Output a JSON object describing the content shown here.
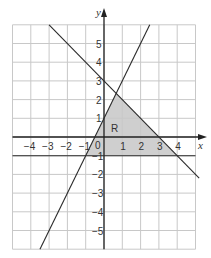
{
  "figure": {
    "axes": {
      "x_label": "x",
      "y_label": "y",
      "x_range": [
        -5,
        5
      ],
      "y_range": [
        -6,
        6
      ],
      "grid": true
    },
    "x_ticks": [
      "-4",
      "-3",
      "-2",
      "-1",
      "1",
      "2",
      "3",
      "4"
    ],
    "y_ticks": [
      "5",
      "4",
      "3",
      "2",
      "1",
      "-1",
      "-2",
      "-3",
      "-4",
      "-5"
    ],
    "origin_label": "0",
    "region_label": "R",
    "lines": [
      {
        "name": "y = 2x + 1",
        "from": [
          -3.5,
          -6
        ],
        "to": [
          2.5,
          6
        ]
      },
      {
        "name": "x + y = 3",
        "from": [
          -3,
          6
        ],
        "to": [
          5.2,
          -2.2
        ]
      },
      {
        "name": "y = -1",
        "from": [
          -5,
          -1
        ],
        "to": [
          5,
          -1
        ]
      }
    ],
    "region_vertices": [
      [
        -1,
        -1
      ],
      [
        0.667,
        2.333
      ],
      [
        4,
        -1
      ]
    ],
    "colors": {
      "shade": "#cfcfcf",
      "grid": "#c8c8c8",
      "line": "#2a2a2a"
    }
  }
}
